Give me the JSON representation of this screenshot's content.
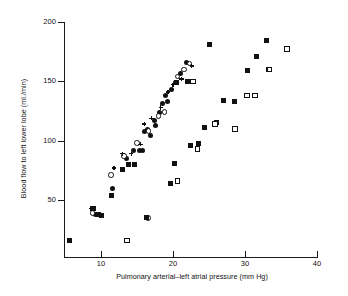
{
  "chart_data": {
    "type": "scatter",
    "title": "",
    "xlabel": "Pulmonary arterial–left atrial pressure (mm Hg)",
    "ylabel": "Blood flow to left lower lobe (ml./min)",
    "xlim": [
      3,
      40
    ],
    "ylim": [
      0,
      200
    ],
    "xticks": [
      10,
      20,
      30,
      40
    ],
    "xtick_labels": [
      "10",
      "20",
      "30",
      "40"
    ],
    "yticks": [
      50,
      100,
      150,
      200
    ],
    "ytick_labels": [
      "50",
      "100",
      "150",
      "200"
    ],
    "grid": false,
    "legend": "none",
    "series": [
      {
        "name": "filled-circle",
        "marker": "filled-circle",
        "points": [
          [
            11.6,
            60
          ],
          [
            13.6,
            85
          ],
          [
            14.5,
            92
          ],
          [
            15.3,
            92
          ],
          [
            15.8,
            92
          ],
          [
            16.1,
            108
          ],
          [
            16.4,
            109
          ],
          [
            16.9,
            104
          ],
          [
            17.4,
            117
          ],
          [
            17.6,
            113
          ],
          [
            18.1,
            124
          ],
          [
            18.5,
            131
          ],
          [
            19.0,
            138
          ],
          [
            19.2,
            133
          ],
          [
            19.8,
            143
          ],
          [
            20.3,
            149
          ],
          [
            21.0,
            157
          ],
          [
            21.9,
            166
          ],
          [
            9.2,
            38
          ]
        ]
      },
      {
        "name": "open-circle",
        "marker": "open-circle",
        "points": [
          [
            11.4,
            71
          ],
          [
            13.2,
            87
          ],
          [
            15.0,
            98
          ],
          [
            16.6,
            108
          ],
          [
            18.0,
            121
          ],
          [
            18.8,
            124
          ],
          [
            20.6,
            154
          ],
          [
            21.5,
            160
          ],
          [
            22.3,
            165
          ],
          [
            8.8,
            39
          ],
          [
            16.5,
            35
          ]
        ]
      },
      {
        "name": "cross",
        "marker": "cross",
        "points": [
          [
            11.8,
            77
          ],
          [
            13.0,
            89
          ],
          [
            14.2,
            89
          ],
          [
            15.5,
            97
          ],
          [
            16.0,
            114
          ],
          [
            17.0,
            119
          ],
          [
            18.3,
            128
          ],
          [
            19.3,
            141
          ],
          [
            20.0,
            147
          ],
          [
            21.2,
            152
          ],
          [
            22.6,
            163
          ],
          [
            8.6,
            43
          ]
        ]
      },
      {
        "name": "filled-square",
        "marker": "filled-square",
        "points": [
          [
            5.6,
            16
          ],
          [
            9.0,
            43
          ],
          [
            9.6,
            38
          ],
          [
            10.0,
            37
          ],
          [
            11.4,
            54
          ],
          [
            13.0,
            76
          ],
          [
            13.8,
            80
          ],
          [
            14.6,
            80
          ],
          [
            16.3,
            35
          ],
          [
            20.2,
            81
          ],
          [
            19.6,
            64
          ],
          [
            22.4,
            96
          ],
          [
            23.6,
            98
          ],
          [
            24.4,
            111
          ],
          [
            25.0,
            181
          ],
          [
            26.0,
            115
          ],
          [
            27.0,
            134
          ],
          [
            28.6,
            133
          ],
          [
            30.4,
            159
          ],
          [
            31.6,
            171
          ],
          [
            33.0,
            184
          ],
          [
            20.5,
            149
          ],
          [
            22.0,
            150
          ],
          [
            33.2,
            160
          ]
        ]
      },
      {
        "name": "open-square",
        "marker": "open-square",
        "points": [
          [
            13.6,
            16
          ],
          [
            20.6,
            66
          ],
          [
            23.4,
            93
          ],
          [
            25.8,
            114
          ],
          [
            28.6,
            110
          ],
          [
            30.3,
            138
          ],
          [
            31.4,
            138
          ],
          [
            33.4,
            160
          ],
          [
            35.8,
            177
          ],
          [
            22.8,
            150
          ]
        ]
      }
    ]
  }
}
